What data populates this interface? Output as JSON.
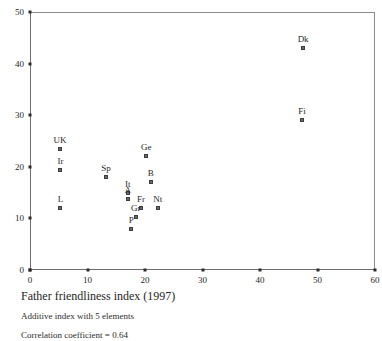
{
  "caption": {
    "title": "Father friendliness index (1997)",
    "subtitle": "Additive index with 5 elements",
    "correlation": "Correlation coefficient = 0.64"
  },
  "chart_data": {
    "type": "scatter",
    "title": "Father friendliness index (1997)",
    "xlabel": "",
    "ylabel": "",
    "xlim": [
      0,
      60
    ],
    "ylim": [
      0,
      50
    ],
    "xticks": [
      0,
      10,
      20,
      30,
      40,
      50,
      60
    ],
    "yticks": [
      0,
      10,
      20,
      30,
      40,
      50
    ],
    "grid": false,
    "legend": "none",
    "annotations": [
      "Additive index with 5 elements",
      "Correlation coefficient = 0.64"
    ],
    "points": [
      {
        "label": "Dk",
        "x": 47.5,
        "y": 43.0
      },
      {
        "label": "Fi",
        "x": 47.3,
        "y": 29.0
      },
      {
        "label": "UK",
        "x": 5.2,
        "y": 23.5
      },
      {
        "label": "Ge",
        "x": 20.2,
        "y": 22.0
      },
      {
        "label": "Ir",
        "x": 5.3,
        "y": 19.3
      },
      {
        "label": "Sp",
        "x": 13.2,
        "y": 18.0
      },
      {
        "label": "B",
        "x": 21.0,
        "y": 17.0
      },
      {
        "label": "It",
        "x": 17.0,
        "y": 15.0
      },
      {
        "label": "A",
        "x": 17.0,
        "y": 13.8
      },
      {
        "label": "L",
        "x": 5.3,
        "y": 12.0
      },
      {
        "label": "Fr",
        "x": 19.3,
        "y": 12.0
      },
      {
        "label": "Nt",
        "x": 22.2,
        "y": 12.0
      },
      {
        "label": "Gr",
        "x": 18.4,
        "y": 10.2
      },
      {
        "label": "P",
        "x": 17.6,
        "y": 8.0
      }
    ]
  }
}
